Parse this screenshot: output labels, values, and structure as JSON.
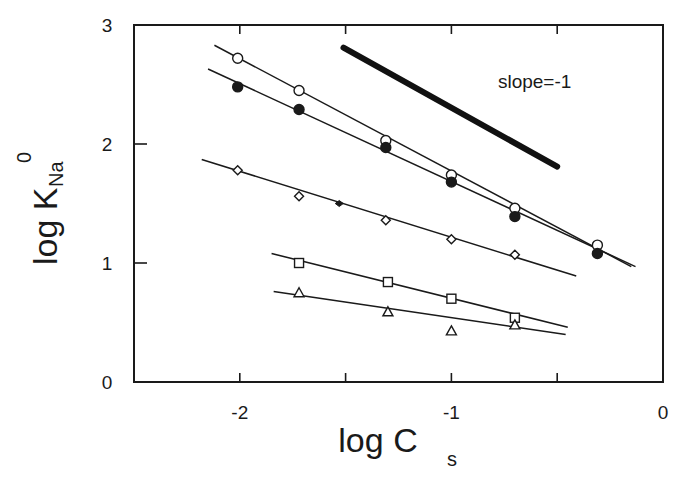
{
  "chart_data": {
    "type": "scatter",
    "title": "",
    "xlabel": "log C",
    "xlabel_subscript": "s",
    "ylabel": "log K",
    "ylabel_subscript": "Na",
    "ylabel_superscript": "0",
    "xlim": [
      -2.5,
      0
    ],
    "ylim": [
      0,
      3
    ],
    "grid": false,
    "legend": null,
    "x_ticks": [
      -2,
      -1.5,
      -1,
      -0.5,
      0
    ],
    "x_tick_labels": [
      "-2",
      "",
      "-1",
      "",
      "0"
    ],
    "y_ticks": [
      0,
      1,
      2,
      3
    ],
    "y_tick_labels": [
      "0",
      "1",
      "2",
      "3"
    ],
    "series": [
      {
        "name": "open circles",
        "marker": "circle-open",
        "x": [
          -2.01,
          -1.72,
          -1.31,
          -1.0,
          -0.7,
          -0.31
        ],
        "y": [
          2.72,
          2.45,
          2.03,
          1.74,
          1.46,
          1.15
        ],
        "fit_line": {
          "x": [
            -2.12,
            -0.15
          ],
          "y": [
            2.83,
            0.97
          ]
        }
      },
      {
        "name": "filled circles",
        "marker": "circle-filled",
        "x": [
          -2.01,
          -1.72,
          -1.31,
          -1.0,
          -0.7,
          -0.31
        ],
        "y": [
          2.48,
          2.29,
          1.97,
          1.68,
          1.39,
          1.08
        ],
        "fit_line": {
          "x": [
            -2.15,
            -0.13
          ],
          "y": [
            2.63,
            0.97
          ]
        }
      },
      {
        "name": "open diamonds",
        "marker": "diamond-open",
        "x": [
          -2.01,
          -1.72,
          -1.31,
          -1.0,
          -0.7
        ],
        "y": [
          1.78,
          1.56,
          1.36,
          1.2,
          1.07
        ],
        "fit_line": {
          "x": [
            -2.18,
            -0.41
          ],
          "y": [
            1.87,
            0.89
          ]
        }
      },
      {
        "name": "open squares",
        "marker": "square-open",
        "x": [
          -1.72,
          -1.3,
          -1.0,
          -0.7
        ],
        "y": [
          1.0,
          0.84,
          0.7,
          0.54
        ],
        "fit_line": {
          "x": [
            -1.85,
            -0.45
          ],
          "y": [
            1.08,
            0.46
          ]
        }
      },
      {
        "name": "open triangles",
        "marker": "triangle-open",
        "x": [
          -1.72,
          -1.3,
          -1.0,
          -0.7
        ],
        "y": [
          0.75,
          0.59,
          0.43,
          0.48
        ],
        "fit_line": {
          "x": [
            -1.84,
            -0.46
          ],
          "y": [
            0.76,
            0.4
          ]
        }
      }
    ],
    "extra_marks": [
      {
        "marker": "diamond-filled-small",
        "x": -1.53,
        "y": 1.5
      }
    ],
    "reference_line": {
      "label": "slope=-1",
      "x": [
        -1.51,
        -0.5
      ],
      "y": [
        2.81,
        1.81
      ],
      "style": "thick",
      "label_position": {
        "x": -0.78,
        "y": 2.53
      }
    }
  }
}
